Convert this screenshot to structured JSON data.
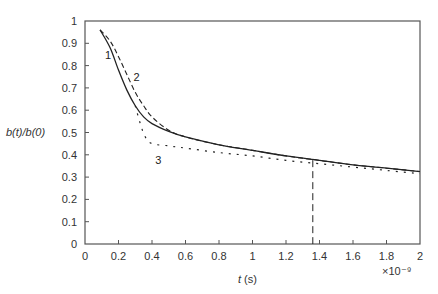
{
  "chart_data": {
    "type": "line",
    "title": "",
    "xlabel": "t (s)",
    "xlabel_italic_part": "t",
    "xlabel_unit_part": " (s)",
    "ylabel": "b(t)/b(0)",
    "x_multiplier": "×10⁻⁹",
    "xlim": [
      0,
      2
    ],
    "ylim": [
      0,
      1
    ],
    "grid": false,
    "legend": "inline curve labels",
    "x_ticks": [
      "0",
      "0.2",
      "0.4",
      "0.6",
      "0.8",
      "1",
      "1.2",
      "1.4",
      "1.6",
      "1.8",
      "2"
    ],
    "y_ticks": [
      "0",
      "0.1",
      "0.2",
      "0.3",
      "0.4",
      "0.5",
      "0.6",
      "0.7",
      "0.8",
      "0.9",
      "1"
    ],
    "series": [
      {
        "name": "1",
        "style": "solid",
        "x": [
          0.09,
          0.15,
          0.2,
          0.25,
          0.3,
          0.35,
          0.4,
          0.5,
          0.6,
          0.8,
          1.0,
          1.2,
          1.4,
          1.6,
          1.8,
          2.0
        ],
        "y": [
          0.96,
          0.88,
          0.78,
          0.69,
          0.62,
          0.57,
          0.54,
          0.505,
          0.48,
          0.445,
          0.42,
          0.395,
          0.375,
          0.355,
          0.34,
          0.325
        ]
      },
      {
        "name": "2",
        "style": "dashed",
        "x": [
          0.09,
          0.15,
          0.2,
          0.25,
          0.3,
          0.35,
          0.4,
          0.5,
          0.6,
          0.8,
          1.0,
          1.2,
          1.4,
          1.6,
          1.8,
          2.0
        ],
        "y": [
          0.96,
          0.91,
          0.84,
          0.76,
          0.68,
          0.62,
          0.57,
          0.51,
          0.48,
          0.445,
          0.42,
          0.395,
          0.375,
          0.355,
          0.34,
          0.325
        ]
      },
      {
        "name": "3",
        "style": "dotted",
        "x": [
          0.3,
          0.33,
          0.36,
          0.4,
          0.5,
          0.6,
          0.8,
          1.0,
          1.2,
          1.4,
          1.6,
          1.8,
          2.0
        ],
        "y": [
          0.62,
          0.54,
          0.48,
          0.45,
          0.44,
          0.43,
          0.41,
          0.395,
          0.375,
          0.36,
          0.345,
          0.33,
          0.315
        ]
      }
    ],
    "annotations": [
      {
        "type": "vertical-dashed-line",
        "x": 1.36,
        "y_top": 0.376,
        "y_bottom": 0
      },
      {
        "type": "curve-label",
        "text": "1",
        "x": 0.12,
        "y": 0.83
      },
      {
        "type": "curve-label",
        "text": "2",
        "x": 0.29,
        "y": 0.73
      },
      {
        "type": "curve-label",
        "text": "3",
        "x": 0.42,
        "y": 0.36
      }
    ]
  }
}
